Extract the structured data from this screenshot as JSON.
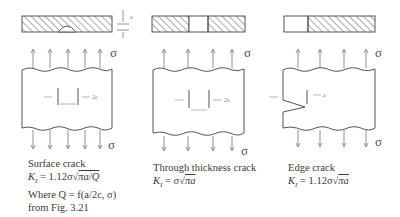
{
  "panels": [
    {
      "id": "surface",
      "title": "Surface crack",
      "formula_lhs": "K",
      "formula_sub": "I",
      "formula_rhs": "= 1.12σ",
      "formula_root": "πa/Q",
      "note_line1": "Where Q = f(a/2c, σ)",
      "note_line2": "from Fig. 3.21",
      "stress_symbol": "σ",
      "dim_label": "2c",
      "depth_label": "a"
    },
    {
      "id": "through",
      "title": "Through thickness crack",
      "formula_lhs": "K",
      "formula_sub": "I",
      "formula_rhs": "= σ",
      "formula_root": "πa",
      "stress_symbol": "σ",
      "dim_label": "2a"
    },
    {
      "id": "edge",
      "title": "Edge crack",
      "formula_lhs": "K",
      "formula_sub": "I",
      "formula_rhs": "= 1.12σ",
      "formula_root": "πa",
      "stress_symbol": "σ",
      "dim_label": "a"
    }
  ]
}
